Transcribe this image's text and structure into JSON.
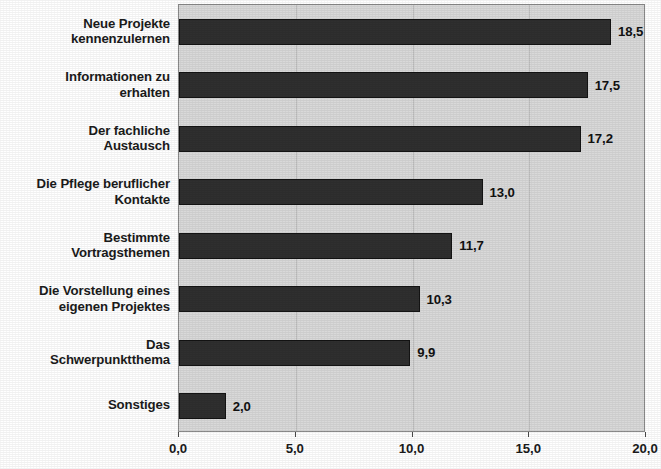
{
  "chart_data": {
    "type": "bar",
    "orientation": "horizontal",
    "title": "",
    "subtitle": "",
    "xlabel": "",
    "ylabel": "",
    "xlim": [
      0,
      20
    ],
    "grid": true,
    "gridlines_at": [
      5,
      10,
      15
    ],
    "legend": null,
    "decimal_separator": ",",
    "bar_color": "#2f2f2f",
    "plot_background": "#d9d9d9",
    "categories": [
      "Neue Projekte\nkennenzulernen",
      "Informationen zu\nerhalten",
      "Der fachliche\nAustausch",
      "Die Pflege beruflicher\nKontakte",
      "Bestimmte\nVortragsthemen",
      "Die Vorstellung eines\neigenen Projektes",
      "Das\nSchwerpunktthema",
      "Sonstiges"
    ],
    "values": [
      18.5,
      17.5,
      17.2,
      13.0,
      11.7,
      10.3,
      9.9,
      2.0
    ],
    "value_labels": [
      "18,5",
      "17,5",
      "17,2",
      "13,0",
      "11,7",
      "10,3",
      "9,9",
      "2,0"
    ],
    "tick_values": [
      0,
      5,
      10,
      15,
      20
    ],
    "tick_labels": [
      "0,0",
      "5,0",
      "10,0",
      "15,0",
      "20,0"
    ]
  }
}
